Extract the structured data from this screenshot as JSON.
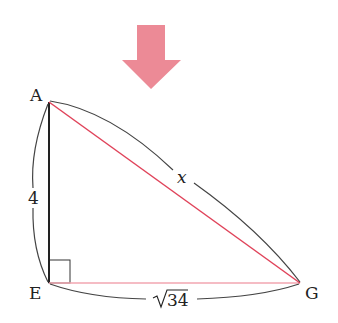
{
  "arrow": {
    "color": "#ec8a96",
    "direction": "down"
  },
  "triangle": {
    "vertices": {
      "A": "A",
      "E": "E",
      "G": "G"
    },
    "side_AE": "4",
    "side_EG_radicand": "34",
    "side_AG": "x",
    "right_angle_at": "E",
    "colors": {
      "black": "#333333",
      "red": "#e0435a",
      "red_light": "#f2a6b0"
    }
  }
}
